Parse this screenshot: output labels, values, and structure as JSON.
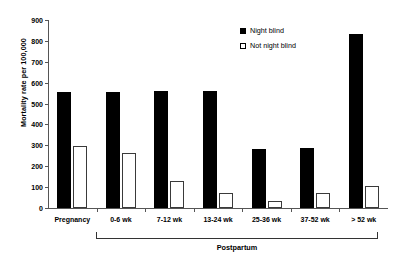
{
  "chart_data": {
    "type": "bar",
    "title": "",
    "subtitle": "",
    "xlabel": "Postpartum",
    "ylabel": "Mortality rate per 100,000",
    "categories": [
      "Pregnancy",
      "0-6 wk",
      "7-12 wk",
      "13-24 wk",
      "25-36 wk",
      "37-52 wk",
      "> 52 wk"
    ],
    "series": [
      {
        "name": "Night blind",
        "values": [
          555,
          555,
          558,
          560,
          283,
          285,
          835
        ],
        "color": "#000000"
      },
      {
        "name": "Not night blind",
        "values": [
          295,
          262,
          130,
          70,
          35,
          70,
          105
        ],
        "color": "#ffffff"
      }
    ],
    "ylim": [
      0,
      900
    ],
    "yticks": [
      0,
      100,
      200,
      300,
      400,
      500,
      600,
      700,
      800,
      900
    ],
    "ytick_labels": [
      "0",
      "100",
      "200",
      "300",
      "400",
      "500",
      "600",
      "700",
      "800",
      "900"
    ],
    "grid": false,
    "legend_position": "top-right",
    "group_bracket": {
      "label": "Postpartum",
      "spans_categories": [
        "0-6 wk",
        "7-12 wk",
        "13-24 wk",
        "25-36 wk",
        "37-52 wk",
        "> 52 wk"
      ]
    }
  },
  "legend": {
    "items": [
      {
        "label": "Night blind",
        "marker": "filled-square"
      },
      {
        "label": "Not night blind",
        "marker": "open-square"
      }
    ]
  },
  "axes": {
    "y_title": "Mortality rate per 100,000",
    "x_group_title": "Postpartum"
  }
}
